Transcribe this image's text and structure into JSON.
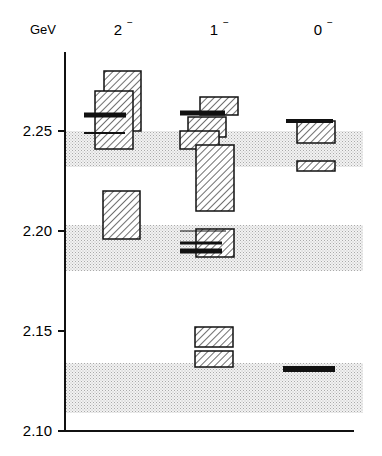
{
  "chart_data": {
    "type": "level-diagram",
    "title": "",
    "ylabel": "GeV",
    "ylim": [
      2.1,
      2.27
    ],
    "yticks": [
      2.1,
      2.15,
      2.2,
      2.25
    ],
    "ytick_labels": [
      "2.10",
      "2.15",
      "2.20",
      "2.25"
    ],
    "columns": [
      {
        "label": "2",
        "sup": "−"
      },
      {
        "label": "1",
        "sup": "−"
      },
      {
        "label": "0",
        "sup": "−"
      }
    ],
    "bands": [
      {
        "ymin": 2.232,
        "ymax": 2.25
      },
      {
        "ymin": 2.18,
        "ymax": 2.203
      },
      {
        "ymin": 2.109,
        "ymax": 2.134
      }
    ],
    "boxes": [
      {
        "column": "2-",
        "ymin": 2.25,
        "ymax": 2.28,
        "x0": 104,
        "x1": 141
      },
      {
        "column": "2-",
        "ymin": 2.241,
        "ymax": 2.27,
        "x0": 95,
        "x1": 133
      },
      {
        "column": "2-",
        "ymin": 2.196,
        "ymax": 2.22,
        "x0": 103,
        "x1": 140
      },
      {
        "column": "1-",
        "ymin": 2.258,
        "ymax": 2.267,
        "x0": 200,
        "x1": 238
      },
      {
        "column": "1-",
        "ymin": 2.247,
        "ymax": 2.257,
        "x0": 188,
        "x1": 226
      },
      {
        "column": "1-",
        "ymin": 2.241,
        "ymax": 2.25,
        "x0": 180,
        "x1": 219
      },
      {
        "column": "1-",
        "ymin": 2.21,
        "ymax": 2.243,
        "x0": 196,
        "x1": 234
      },
      {
        "column": "1-",
        "ymin": 2.187,
        "ymax": 2.201,
        "x0": 196,
        "x1": 234
      },
      {
        "column": "1-",
        "ymin": 2.142,
        "ymax": 2.152,
        "x0": 195,
        "x1": 233
      },
      {
        "column": "1-",
        "ymin": 2.132,
        "ymax": 2.14,
        "x0": 195,
        "x1": 233
      },
      {
        "column": "0-",
        "ymin": 2.244,
        "ymax": 2.255,
        "x0": 297,
        "x1": 335
      },
      {
        "column": "0-",
        "ymin": 2.23,
        "ymax": 2.235,
        "x0": 297,
        "x1": 335
      }
    ],
    "lines": [
      {
        "column": "2-",
        "y": 2.258,
        "x0": 84,
        "x1": 126,
        "thick": 5
      },
      {
        "column": "2-",
        "y": 2.249,
        "x0": 84,
        "x1": 125,
        "thick": 2
      },
      {
        "column": "1-",
        "y": 2.259,
        "x0": 180,
        "x1": 225,
        "thick": 5
      },
      {
        "column": "1-",
        "y": 2.2,
        "x0": 180,
        "x1": 226,
        "thick": 1
      },
      {
        "column": "1-",
        "y": 2.194,
        "x0": 180,
        "x1": 222,
        "thick": 3
      },
      {
        "column": "1-",
        "y": 2.19,
        "x0": 180,
        "x1": 222,
        "thick": 5
      },
      {
        "column": "0-",
        "y": 2.255,
        "x0": 286,
        "x1": 333,
        "thick": 4
      },
      {
        "column": "0-",
        "y": 2.131,
        "x0": 283,
        "x1": 335,
        "thick": 6
      }
    ]
  }
}
